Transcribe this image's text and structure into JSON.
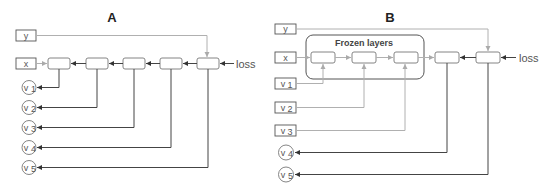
{
  "panel_a": {
    "title": "A",
    "inputs": {
      "y": "y",
      "x": "x"
    },
    "loss_label": "loss",
    "outputs": [
      {
        "base": "v",
        "sub": "1"
      },
      {
        "base": "v",
        "sub": "2"
      },
      {
        "base": "v",
        "sub": "3"
      },
      {
        "base": "v",
        "sub": "4"
      },
      {
        "base": "v",
        "sub": "5"
      }
    ],
    "layer_count": 5
  },
  "panel_b": {
    "title": "B",
    "inputs": {
      "y": "y",
      "x": "x"
    },
    "frozen_label": "Frozen layers",
    "loss_label": "loss",
    "fixed_inputs": [
      {
        "base": "v",
        "sub": "1"
      },
      {
        "base": "v",
        "sub": "2"
      },
      {
        "base": "v",
        "sub": "3"
      }
    ],
    "outputs": [
      {
        "base": "v",
        "sub": "4"
      },
      {
        "base": "v",
        "sub": "5"
      }
    ],
    "layer_count": 5,
    "frozen_layer_count": 3
  },
  "colors": {
    "dark_line": "#444444",
    "light_line": "#b0b0b0",
    "box_stroke": "#555555"
  }
}
